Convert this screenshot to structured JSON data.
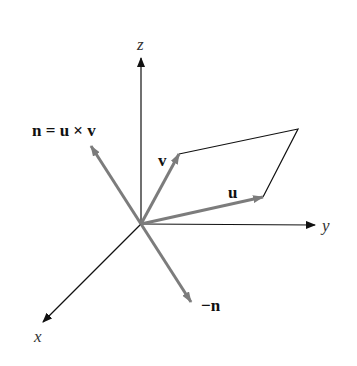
{
  "figure": {
    "axes": {
      "x_label": "x",
      "y_label": "y",
      "z_label": "z"
    },
    "vectors": {
      "u_label": "u",
      "v_label": "v",
      "n_label": "n = u × v",
      "neg_n_label": "−n"
    },
    "colors": {
      "axis": "#111111",
      "vector": "#7c7c7c",
      "background": "#ffffff"
    }
  }
}
